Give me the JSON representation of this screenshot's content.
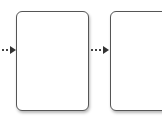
{
  "diagram": {
    "type": "flowchart",
    "background": "#ffffff",
    "stroke_color": "#555555",
    "arrow_color": "#333333",
    "connectors": [
      {
        "id": "connector-1",
        "style": "dotted",
        "direction": "right",
        "target": "box-1"
      },
      {
        "id": "connector-2",
        "style": "dotted",
        "direction": "right",
        "source": "box-1",
        "target": "box-2"
      }
    ],
    "nodes": [
      {
        "id": "box-1",
        "shape": "rounded-rectangle",
        "label": ""
      },
      {
        "id": "box-2",
        "shape": "rounded-rectangle",
        "label": "",
        "clipped": true
      }
    ]
  }
}
